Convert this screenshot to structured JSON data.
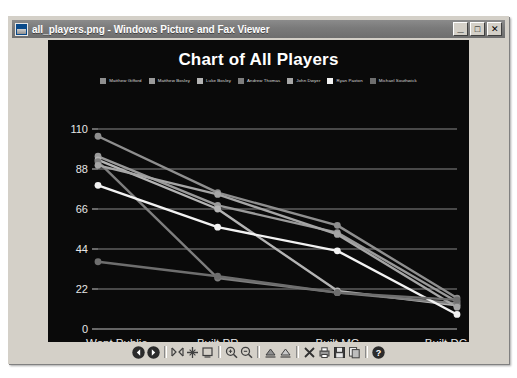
{
  "window": {
    "title": "all_players.png - Windows Picture and Fax Viewer",
    "app_icon": "picture-viewer-icon",
    "controls": {
      "minimize": "_",
      "maximize": "☐",
      "close": "✕"
    }
  },
  "toolbar": {
    "buttons": [
      {
        "name": "previous-image-button",
        "icon": "previous-icon",
        "label": "❮"
      },
      {
        "name": "next-image-button",
        "icon": "next-icon",
        "label": "❯"
      },
      {
        "name": "best-fit-button",
        "icon": "best-fit-icon",
        "label": "best-fit"
      },
      {
        "name": "actual-size-button",
        "icon": "actual-size-icon",
        "label": "actual-size"
      },
      {
        "name": "slideshow-button",
        "icon": "slideshow-icon",
        "label": "slideshow"
      },
      {
        "name": "zoom-in-button",
        "icon": "zoom-in-icon",
        "label": "zoom-in"
      },
      {
        "name": "zoom-out-button",
        "icon": "zoom-out-icon",
        "label": "zoom-out"
      },
      {
        "name": "rotate-clockwise-button",
        "icon": "rotate-cw-icon",
        "label": "rotate-cw"
      },
      {
        "name": "rotate-counterclockwise-button",
        "icon": "rotate-ccw-icon",
        "label": "rotate-ccw"
      },
      {
        "name": "delete-button",
        "icon": "delete-x-icon",
        "label": "delete"
      },
      {
        "name": "print-button",
        "icon": "print-icon",
        "label": "print"
      },
      {
        "name": "save-as-button",
        "icon": "save-disk-icon",
        "label": "save-as"
      },
      {
        "name": "copy-to-button",
        "icon": "copy-icon",
        "label": "copy-to"
      },
      {
        "name": "help-button",
        "icon": "help-icon",
        "label": "help"
      }
    ]
  },
  "chart_data": {
    "type": "line",
    "title": "Chart of All Players",
    "xlabel": "",
    "ylabel": "",
    "categories": [
      "Went Public",
      "Built PR",
      "Built MC",
      "Built DC"
    ],
    "yticks": [
      0,
      22,
      44,
      66,
      88,
      110
    ],
    "ylim": [
      0,
      110
    ],
    "grid": true,
    "legend_position": "top",
    "background": "#0a0a0a",
    "series": [
      {
        "name": "Matthew Gifford",
        "color": "#8f8f8f",
        "values": [
          106,
          75,
          57,
          17
        ]
      },
      {
        "name": "Matthew Bosley",
        "color": "#9a9a9a",
        "values": [
          95,
          68,
          53,
          15
        ]
      },
      {
        "name": "Luke Bosley",
        "color": "#b4b4b4",
        "values": [
          93,
          66,
          21,
          13
        ]
      },
      {
        "name": "Andrew Thomas",
        "color": "#7e7e7e",
        "values": [
          92,
          28,
          20,
          14
        ]
      },
      {
        "name": "John Dwyer",
        "color": "#a6a6a6",
        "values": [
          90,
          74,
          52,
          12
        ]
      },
      {
        "name": "Ryan Paxton",
        "color": "#f2f2f2",
        "values": [
          79,
          56,
          43,
          8
        ]
      },
      {
        "name": "Michael Southwick",
        "color": "#6e6e6e",
        "values": [
          37,
          29,
          20,
          16
        ]
      }
    ]
  }
}
